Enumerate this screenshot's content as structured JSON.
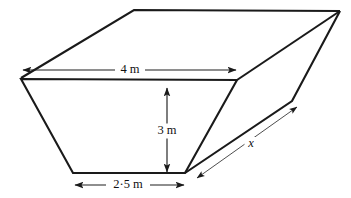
{
  "figure": {
    "kind": "skip-container-prism",
    "stroke_color": "#1a1a1a",
    "background_color": "#ffffff",
    "dimension_labels": {
      "top_width": "4 m",
      "height": "3 m",
      "bottom_width": "2·5 m",
      "depth": "x"
    },
    "labels": [
      {
        "id": "top-width",
        "text": "4 m",
        "x": 130,
        "y": 70,
        "italic": false,
        "bg_w": 30,
        "bg_h": 15
      },
      {
        "id": "height",
        "text": "3 m",
        "x": 167,
        "y": 131,
        "italic": false,
        "bg_w": 30,
        "bg_h": 15
      },
      {
        "id": "bottom-width",
        "text": "2·5 m",
        "x": 128,
        "y": 185,
        "italic": false,
        "bg_w": 44,
        "bg_h": 15
      },
      {
        "id": "depth",
        "text": "x",
        "x": 251,
        "y": 144,
        "italic": true,
        "bg_w": 13,
        "bg_h": 14
      }
    ],
    "solid_paths": [
      {
        "id": "back-top-edge",
        "d": "M 21 78 L 134 10 L 340 11"
      },
      {
        "id": "front-face-outline",
        "d": "M 21 79 L 73 173 L 185 173 L 237 80 Z"
      },
      {
        "id": "right-face-upper",
        "d": "M 237 80 L 340 11"
      },
      {
        "id": "right-face-lower",
        "d": "M 340 11 L 292 101 L 185 173"
      }
    ],
    "dimension_lines": [
      {
        "id": "top-width-dim",
        "x1": 23,
        "y1": 70,
        "x2": 236,
        "y2": 70,
        "arrow_start": true,
        "arrow_end": true,
        "thin": false
      },
      {
        "id": "height-dim",
        "x1": 167,
        "y1": 88,
        "x2": 167,
        "y2": 172,
        "arrow_start": true,
        "arrow_end": true,
        "thin": false
      },
      {
        "id": "bottom-width-dim",
        "x1": 75,
        "y1": 185,
        "x2": 184,
        "y2": 185,
        "arrow_start": true,
        "arrow_end": true,
        "thin": false
      },
      {
        "id": "depth-dim",
        "x1": 197,
        "y1": 178,
        "x2": 297,
        "y2": 107,
        "arrow_start": true,
        "arrow_end": true,
        "thin": true
      }
    ]
  }
}
